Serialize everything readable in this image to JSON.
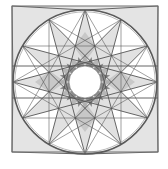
{
  "figure": {
    "title": "",
    "square": {
      "x": 12,
      "y": 6,
      "size": 146,
      "stroke": "#6e6e6e",
      "fill": "#e4e4e4"
    },
    "outer_circle": {
      "cx": 85,
      "cy": 82,
      "r": 72,
      "stroke": "#5a5a5a"
    },
    "inner_circle": {
      "cx": 85,
      "cy": 82,
      "r": 16,
      "fill": "#ffffff"
    },
    "star": {
      "points": 12,
      "skip": 5,
      "stroke": "#555555",
      "fill_light": "#d0d0d0",
      "fill_dark": "#8a8a8a"
    },
    "horizontal_lines_y": [
      66,
      98
    ],
    "colors": {
      "background": "#ffffff",
      "light_gray": "#e4e4e4",
      "mid_gray": "#c4c4c4",
      "dark_gray": "#7e7e7e",
      "line": "#555555"
    }
  }
}
